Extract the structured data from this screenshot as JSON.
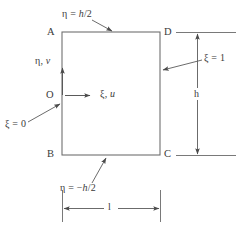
{
  "figure": {
    "type": "engineering-domain-diagram",
    "stroke_color": "#5a5a5a",
    "text_color": "#3a3a3a",
    "background_color": "#ffffff"
  },
  "rectangle": {
    "x": 62,
    "y": 32,
    "width": 98,
    "height": 123
  },
  "corners": {
    "top_left": "A",
    "top_right": "D",
    "bottom_left": "B",
    "bottom_right": "C",
    "origin": "O"
  },
  "labels": {
    "top_edge": "η = h/2",
    "bottom_edge": "η = −h/2",
    "left_edge": "ξ = 0",
    "right_edge": "ξ = 1",
    "vertical_axis": "η, v",
    "horizontal_axis": "ξ, u",
    "height_dim": "h",
    "length_dim": "l"
  },
  "label_parts": {
    "top_edge_prefix": "η = ",
    "top_edge_italic": "h",
    "top_edge_suffix": "/2",
    "bottom_edge_prefix": "η = −",
    "bottom_edge_italic": "h",
    "bottom_edge_suffix": "/2",
    "left_edge_prefix": "ξ = ",
    "left_edge_value": "0",
    "right_edge_prefix": "ξ = ",
    "right_edge_value": "1",
    "vertical_axis_greek": "η, ",
    "vertical_axis_italic": "v",
    "horizontal_axis_greek": "ξ, ",
    "horizontal_axis_italic": "u"
  },
  "annotations": {
    "top_leader": {
      "from_x": 97,
      "from_y": 20,
      "to_x": 115,
      "to_y": 32
    },
    "bottom_leader": {
      "from_x": 86,
      "from_y": 188,
      "to_x": 105,
      "to_y": 157
    },
    "left_leader": {
      "from_x": 30,
      "from_y": 123,
      "to_x": 62,
      "to_y": 104
    },
    "right_leader": {
      "from_x": 200,
      "from_y": 60,
      "to_x": 161,
      "to_y": 70
    }
  }
}
